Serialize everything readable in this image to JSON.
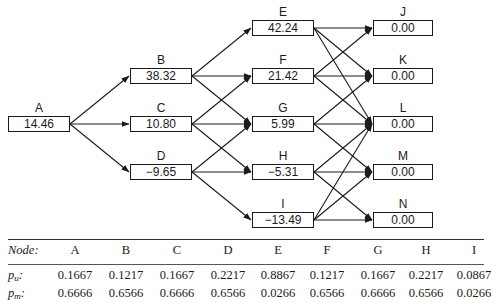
{
  "diagram": {
    "nodes": {
      "A": {
        "label": "A",
        "value": "14.46"
      },
      "B": {
        "label": "B",
        "value": "38.32"
      },
      "C": {
        "label": "C",
        "value": "10.80"
      },
      "D": {
        "label": "D",
        "value": "−9.65"
      },
      "E": {
        "label": "E",
        "value": "42.24"
      },
      "F": {
        "label": "F",
        "value": "21.42"
      },
      "G": {
        "label": "G",
        "value": "5.99"
      },
      "H": {
        "label": "H",
        "value": "−5.31"
      },
      "I": {
        "label": "I",
        "value": "−13.49"
      },
      "J": {
        "label": "J",
        "value": "0.00"
      },
      "K": {
        "label": "K",
        "value": "0.00"
      },
      "L": {
        "label": "L",
        "value": "0.00"
      },
      "M": {
        "label": "M",
        "value": "0.00"
      },
      "N": {
        "label": "N",
        "value": "0.00"
      }
    },
    "edges": [
      [
        "A",
        "B"
      ],
      [
        "A",
        "C"
      ],
      [
        "A",
        "D"
      ],
      [
        "B",
        "E"
      ],
      [
        "B",
        "F"
      ],
      [
        "B",
        "G"
      ],
      [
        "C",
        "F"
      ],
      [
        "C",
        "G"
      ],
      [
        "C",
        "H"
      ],
      [
        "D",
        "G"
      ],
      [
        "D",
        "H"
      ],
      [
        "D",
        "I"
      ],
      [
        "E",
        "J"
      ],
      [
        "E",
        "K"
      ],
      [
        "E",
        "L"
      ],
      [
        "F",
        "J"
      ],
      [
        "F",
        "K"
      ],
      [
        "F",
        "L"
      ],
      [
        "G",
        "K"
      ],
      [
        "G",
        "L"
      ],
      [
        "G",
        "M"
      ],
      [
        "H",
        "L"
      ],
      [
        "H",
        "M"
      ],
      [
        "H",
        "N"
      ],
      [
        "I",
        "L"
      ],
      [
        "I",
        "M"
      ],
      [
        "I",
        "N"
      ]
    ]
  },
  "table": {
    "header_label": "Node:",
    "columns": [
      "A",
      "B",
      "C",
      "D",
      "E",
      "F",
      "G",
      "H",
      "I"
    ],
    "rows": [
      {
        "label_base": "p",
        "label_sub": "u",
        "label_suffix": ":",
        "values": [
          "0.1667",
          "0.1217",
          "0.1667",
          "0.2217",
          "0.8867",
          "0.1217",
          "0.1667",
          "0.2217",
          "0.0867"
        ]
      },
      {
        "label_base": "p",
        "label_sub": "m",
        "label_suffix": ":",
        "values": [
          "0.6666",
          "0.6566",
          "0.6666",
          "0.6566",
          "0.0266",
          "0.6566",
          "0.6666",
          "0.6566",
          "0.0266"
        ]
      }
    ]
  }
}
